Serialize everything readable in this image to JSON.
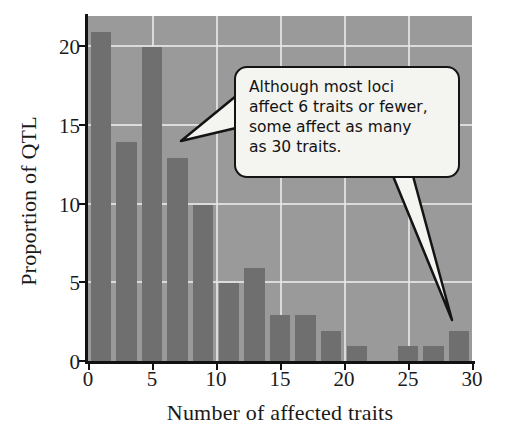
{
  "chart_data": {
    "type": "bar",
    "title": "",
    "xlabel": "Number of affected traits",
    "ylabel": "Proportion of QTL",
    "xlim": [
      0,
      30
    ],
    "ylim": [
      0,
      22
    ],
    "xticks": [
      0,
      5,
      10,
      15,
      20,
      25,
      30
    ],
    "yticks": [
      0,
      5,
      10,
      15,
      20
    ],
    "grid": true,
    "legend": null,
    "bar_width_units": 1.6,
    "x": [
      1,
      3,
      5,
      7,
      9,
      11,
      13,
      15,
      17,
      19,
      21,
      25,
      27,
      29
    ],
    "values": [
      21,
      14,
      20,
      13,
      10,
      5,
      6,
      3,
      3,
      2,
      1,
      1,
      1,
      2
    ],
    "bars": [
      {
        "x": 1,
        "value": 21
      },
      {
        "x": 3,
        "value": 14
      },
      {
        "x": 5,
        "value": 20
      },
      {
        "x": 7,
        "value": 13
      },
      {
        "x": 9,
        "value": 10
      },
      {
        "x": 11,
        "value": 5
      },
      {
        "x": 13,
        "value": 6
      },
      {
        "x": 15,
        "value": 3
      },
      {
        "x": 17,
        "value": 3
      },
      {
        "x": 19,
        "value": 2
      },
      {
        "x": 21,
        "value": 1
      },
      {
        "x": 25,
        "value": 1
      },
      {
        "x": 27,
        "value": 1
      },
      {
        "x": 29,
        "value": 2
      }
    ],
    "annotations": [
      {
        "id": "callout",
        "lines": [
          "Although most loci",
          "affect 6 traits or fewer,",
          "some affect as many",
          "as 30 traits."
        ],
        "points_to": [
          {
            "x": 7,
            "y": 13
          },
          {
            "x": 29,
            "y": 2
          }
        ]
      }
    ],
    "colors": {
      "bar": "#6f6f6f",
      "plot_background": "#9a9a9a",
      "gridline": "#e6e6e6",
      "axis": "#121212",
      "callout_fill": "#f4f4f0",
      "callout_border": "#141414",
      "text": "#1a1a1a"
    }
  }
}
